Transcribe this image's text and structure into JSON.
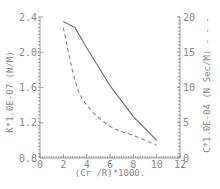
{
  "chart_data": {
    "type": "line",
    "title": "",
    "xlabel": "(Cr /R)*1000.",
    "ylabel_left": "K*1.0E-07 (N/M)",
    "ylabel_right": "C*1.0E-04 (N Sec/M) - - -",
    "xlim": [
      0,
      12
    ],
    "ylim_left": [
      0.8,
      2.4
    ],
    "ylim_right": [
      0,
      20
    ],
    "x_ticks": [
      "0",
      "2",
      "4",
      "6",
      "8",
      "10",
      "12"
    ],
    "y_left_ticks": [
      "0.8",
      "1.2",
      "1.6",
      "2.0",
      "2.4"
    ],
    "y_right_ticks": [
      "0",
      "5",
      "10",
      "15",
      "20"
    ],
    "grid": false,
    "legend": "none (solid = K, left axis; dashed = C, right axis)",
    "series": [
      {
        "name": "K (stiffness)",
        "axis": "left",
        "style": "solid",
        "x": [
          2,
          3,
          4,
          6,
          8,
          10
        ],
        "values": [
          2.35,
          2.28,
          2.05,
          1.62,
          1.27,
          1.0
        ]
      },
      {
        "name": "C (damping)",
        "axis": "right",
        "style": "dashed",
        "x": [
          2,
          3,
          4,
          6,
          8,
          10
        ],
        "values": [
          18.5,
          11.0,
          7.5,
          4.5,
          3.2,
          1.8
        ]
      }
    ]
  },
  "axes": {
    "x_title": "(Cr /R)*1000.",
    "left_title": "K*1.0E-07 (N/M)",
    "right_title": "C*1.0E-04 (N Sec/M) - - -"
  }
}
